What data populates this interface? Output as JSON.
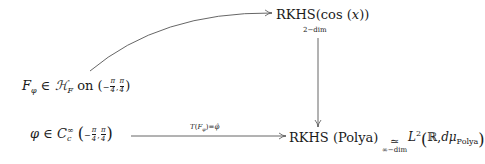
{
  "diagram": {
    "type": "commutative-diagram",
    "nodes": {
      "top_right": {
        "main": "RKHS(cos (x))",
        "main_prefix": "RKHS(cos (",
        "main_var": "x",
        "main_suffix": "))",
        "sub_label": "2−dim"
      },
      "mid_left": {
        "F": "F",
        "F_sub": "φ",
        "in": "∈",
        "H": "ℋ",
        "H_sub": "F",
        "on": "on",
        "neg": "−",
        "pi": "π",
        "four": "4"
      },
      "bottom_left": {
        "phi": "φ",
        "in": "∈",
        "C": "C",
        "C_sub": "c",
        "C_sup": "∞",
        "neg": "−",
        "pi": "π",
        "four": "4"
      },
      "bottom_mid": {
        "text": "RKHS (Polya)"
      },
      "bottom_iso": {
        "symbol": "≃",
        "sub_label": "∞−dim"
      },
      "bottom_right": {
        "L": "L",
        "L_sup": "2",
        "R": "ℝ",
        "comma": ",",
        "dmu": "dμ",
        "dmu_sub": "Polya"
      }
    },
    "edges": [
      {
        "from": "mid_left",
        "to": "top_right",
        "style": "curved-arrow",
        "label": ""
      },
      {
        "from": "top_right",
        "to": "bottom_mid",
        "style": "vertical-arrow",
        "label": ""
      },
      {
        "from": "bottom_left",
        "to": "bottom_mid",
        "style": "horizontal-arrow",
        "label": "T(F_φ)=φ̂",
        "label_T": "T",
        "label_F": "F",
        "label_sub": "φ",
        "label_eq": "=",
        "label_hat": "φ̂"
      },
      {
        "from": "bottom_mid",
        "to": "bottom_right",
        "style": "isomorphism",
        "label": "≃ ∞−dim"
      }
    ],
    "colors": {
      "ink": "#1a1a1a",
      "arrow": "#555555",
      "background": "#ffffff"
    }
  }
}
